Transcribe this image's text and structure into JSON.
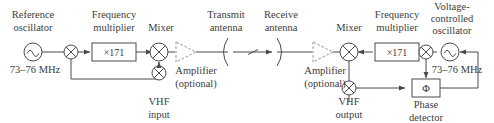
{
  "diagram": {
    "colors": {
      "wire": "#4a4a4a",
      "text": "#3c3c3c",
      "dashed_optional": "#8d8d8d",
      "background": "#ffffff"
    },
    "blocks": {
      "reference_oscillator": {
        "label_line1": "Reference",
        "label_line2": "oscillator",
        "frequency": "73–76 MHz",
        "icon": "sine-wave-oscillator-icon"
      },
      "frequency_multiplier_tx": {
        "label_line1": "Frequency",
        "label_line2": "multiplier",
        "value": "×171"
      },
      "mixer_tx": {
        "label": "Mixer",
        "icon": "mixer-cross-circle-icon"
      },
      "input_summer": {
        "icon": "mixer-cross-circle-icon"
      },
      "vhf_input": {
        "label_line1": "VHF",
        "label_line2": "input",
        "icon": "mixer-cross-circle-icon"
      },
      "amplifier_tx": {
        "label_line1": "Amplifier",
        "label_line2": "(optional)",
        "icon": "amplifier-triangle-icon"
      },
      "transmit_antenna": {
        "label_line1": "Transmit",
        "label_line2": "antenna",
        "icon": "antenna-arc-icon"
      },
      "receive_antenna": {
        "label_line1": "Receive",
        "label_line2": "antenna",
        "icon": "antenna-arc-icon"
      },
      "amplifier_rx": {
        "label_line1": "Amplifier",
        "label_line2": "(optional)",
        "icon": "amplifier-triangle-icon"
      },
      "mixer_rx": {
        "label": "Mixer",
        "icon": "mixer-cross-circle-icon"
      },
      "vhf_output": {
        "label_line1": "VHF",
        "label_line2": "output",
        "icon": "mixer-cross-circle-icon"
      },
      "frequency_multiplier_rx": {
        "label_line1": "Frequency",
        "label_line2": "multiplier",
        "value": "×171"
      },
      "feedback_summer": {
        "icon": "mixer-cross-circle-icon"
      },
      "vco": {
        "label_line1": "Voltage-",
        "label_line2": "controlled",
        "label_line3": "oscillator",
        "frequency": "73–76 MHz",
        "icon": "sine-wave-oscillator-icon"
      },
      "phase_detector": {
        "label_line1": "Phase",
        "label_line2": "detector",
        "symbol": "Φ"
      }
    }
  }
}
